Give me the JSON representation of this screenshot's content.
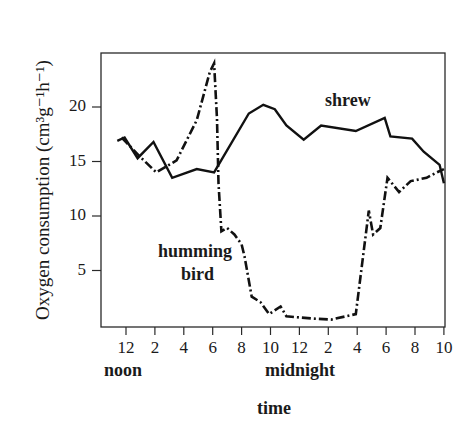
{
  "chart_data": {
    "type": "line",
    "title": "",
    "xlabel": "time",
    "ylabel": "Oxygen consumption (cm³g⁻¹h⁻¹)",
    "x_unit": "hours after noon",
    "xlim": [
      0,
      22
    ],
    "ylim": [
      0,
      25
    ],
    "x_tick_labels": [
      "12",
      "2",
      "4",
      "6",
      "8",
      "10",
      "12",
      "2",
      "4",
      "6",
      "8",
      "10"
    ],
    "x_tick_values": [
      0,
      2,
      4,
      6,
      8,
      10,
      12,
      14,
      16,
      18,
      20,
      22
    ],
    "x_sublabels": [
      {
        "text": "noon",
        "at": 0
      },
      {
        "text": "midnight",
        "at": 12
      }
    ],
    "y_tick_labels": [
      "20",
      "15",
      "10",
      "5"
    ],
    "y_tick_values": [
      20,
      15,
      10,
      5
    ],
    "grid": false,
    "legend": "inline annotations",
    "series": [
      {
        "name": "shrew",
        "style": "solid",
        "x": [
          -0.6,
          -0.1,
          0.8,
          1.9,
          3.2,
          4.9,
          6.1,
          8.5,
          9.5,
          10.3,
          11.1,
          12.3,
          13.5,
          15.9,
          17.9,
          18.3,
          19.8,
          20.6,
          21.7,
          22.0
        ],
        "y": [
          16.9,
          17.2,
          15.3,
          16.8,
          13.5,
          14.3,
          14.0,
          19.4,
          20.2,
          19.8,
          18.3,
          17.0,
          18.3,
          17.8,
          19.0,
          17.3,
          17.1,
          15.9,
          14.7,
          13.0
        ]
      },
      {
        "name": "humming bird",
        "style": "dashdot",
        "x": [
          -0.3,
          1.0,
          2.1,
          3.5,
          4.9,
          5.8,
          6.1,
          6.3,
          6.4,
          6.6,
          7.0,
          7.5,
          8.0,
          8.2,
          8.7,
          9.3,
          9.9,
          10.7,
          11.1,
          12.9,
          14.2,
          15.9,
          16.8,
          17.1,
          17.6,
          18.1,
          18.9,
          19.7,
          20.8,
          21.5,
          22.0
        ],
        "y": [
          17.2,
          15.4,
          14.0,
          15.1,
          18.8,
          23.2,
          24.0,
          18.9,
          13.0,
          8.6,
          8.9,
          8.3,
          7.4,
          6.3,
          2.6,
          2.1,
          1.0,
          1.7,
          0.8,
          0.6,
          0.5,
          1.0,
          10.5,
          8.3,
          8.9,
          13.5,
          12.2,
          13.2,
          13.5,
          14.0,
          14.3
        ]
      }
    ],
    "annotations": [
      {
        "text": "shrew",
        "x": 14.6,
        "y": 21.3
      },
      {
        "text": "humming",
        "x": 4.2,
        "y": 6.8
      },
      {
        "text": "bird",
        "x": 4.6,
        "y": 4.3
      }
    ]
  },
  "labels": {
    "ylabel": "Oxygen consumption (cm³g⁻¹h⁻¹)",
    "xlabel": "time",
    "noon": "noon",
    "midnight": "midnight",
    "shrew": "shrew",
    "humming": "humming",
    "bird": "bird"
  }
}
